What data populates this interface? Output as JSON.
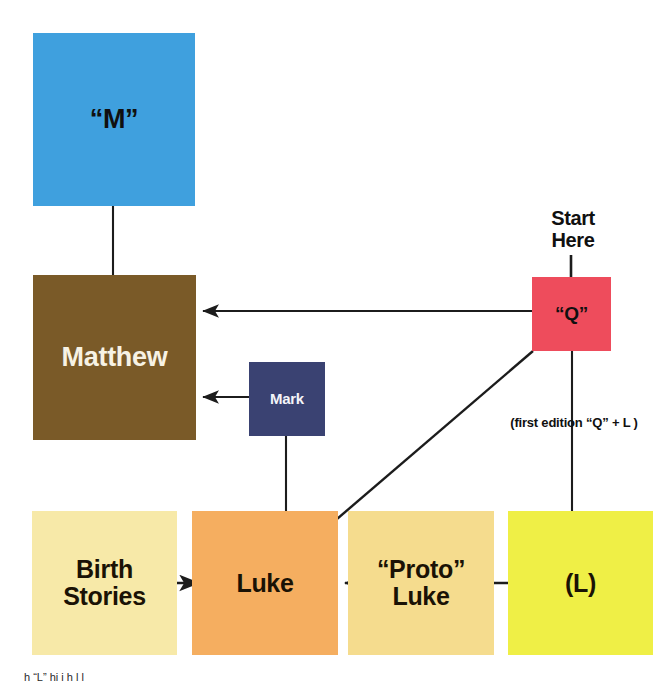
{
  "diagram": {
    "canvas": {
      "width": 670,
      "height": 687,
      "background": "#ffffff"
    },
    "nodes": [
      {
        "id": "m",
        "label": "“M”",
        "color": "#3FA0DE",
        "text_color": "#101010"
      },
      {
        "id": "matthew",
        "label": "Matthew",
        "color": "#7A5A28",
        "text_color": "#F7F2E4"
      },
      {
        "id": "q",
        "label": "“Q”",
        "color": "#EE4C5C",
        "text_color": "#101010"
      },
      {
        "id": "mark",
        "label": "Mark",
        "color": "#3A4272",
        "text_color": "#F4F4F8"
      },
      {
        "id": "birth",
        "label": "Birth\nStories",
        "color": "#F7E9A8",
        "text_color": "#1A1205"
      },
      {
        "id": "luke",
        "label": "Luke",
        "color": "#F5AE60",
        "text_color": "#1A1205"
      },
      {
        "id": "proto",
        "label": "“Proto”\nLuke",
        "color": "#F5DC8E",
        "text_color": "#1A1205"
      },
      {
        "id": "l",
        "label": "(L)",
        "color": "#EFEF46",
        "text_color": "#1A1205"
      }
    ],
    "labels": {
      "start_here": "Start\nHere",
      "first_edition": "(first edition “Q” + L )",
      "footnote": "h  “L”        hi        i  h  l l"
    },
    "edges": [
      {
        "from": "m",
        "to": "matthew",
        "kind": "arrow-down"
      },
      {
        "from": "q",
        "to": "matthew",
        "kind": "arrow-left"
      },
      {
        "from": "mark",
        "to": "matthew",
        "kind": "arrow-left"
      },
      {
        "from": "mark",
        "to": "luke",
        "kind": "arrow-down"
      },
      {
        "from": "q",
        "to": "luke",
        "kind": "arrow-diagonal"
      },
      {
        "from": "q",
        "to": "l",
        "kind": "arrow-down"
      },
      {
        "from": "birth",
        "to": "luke",
        "kind": "arrow-right"
      },
      {
        "from": "proto",
        "to": "luke",
        "kind": "arrow-left"
      },
      {
        "from": "l",
        "to": "proto",
        "kind": "arrow-left"
      },
      {
        "from": "start_here",
        "to": "q",
        "kind": "arrow-down"
      }
    ],
    "edge_color": "#1c1c1c"
  }
}
